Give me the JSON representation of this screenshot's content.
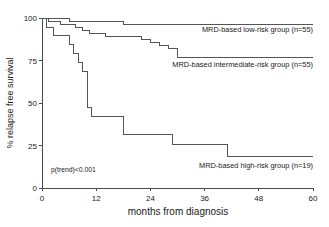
{
  "chart_data": {
    "type": "line",
    "subtype": "kaplan-meier-step",
    "title": "",
    "xlabel": "months from diagnosis",
    "ylabel": "% relapse free survival",
    "xlim": [
      0,
      60
    ],
    "ylim": [
      0,
      100
    ],
    "xticks": [
      0,
      12,
      24,
      36,
      48,
      60
    ],
    "yticks": [
      0,
      25,
      50,
      75,
      100
    ],
    "xtick_labels": [
      "0",
      "12",
      "24",
      "36",
      "48",
      "60"
    ],
    "ytick_labels": [
      "0",
      "25",
      "50",
      "75",
      "100"
    ],
    "grid": false,
    "legend_position": "inline-right-of-curve",
    "annotations": [
      {
        "text": "p(trend)<0.001",
        "x": 2.0,
        "y": 9.5
      }
    ],
    "series": [
      {
        "name": "MRD-based low-risk group (n=55)",
        "n": 55,
        "label": "MRD-based low-risk group (n=55)",
        "label_anchor_x": 60,
        "label_anchor_y": 92,
        "color": "#555555",
        "points": [
          [
            0,
            100
          ],
          [
            6,
            100
          ],
          [
            6,
            98.2
          ],
          [
            18,
            98.2
          ],
          [
            18,
            96.4
          ],
          [
            60,
            96.4
          ]
        ]
      },
      {
        "name": "MRD-based intermediate-risk group (n=55)",
        "n": 55,
        "label": "MRD-based intermediate-risk group (n=55)",
        "label_anchor_x": 60,
        "label_anchor_y": 71,
        "color": "#555555",
        "points": [
          [
            0,
            100
          ],
          [
            1.5,
            100
          ],
          [
            1.5,
            98.2
          ],
          [
            4,
            98.2
          ],
          [
            4,
            96.4
          ],
          [
            7.5,
            96.4
          ],
          [
            7.5,
            94.5
          ],
          [
            9,
            94.5
          ],
          [
            9,
            92.7
          ],
          [
            10.5,
            92.7
          ],
          [
            10.5,
            90.9
          ],
          [
            14,
            90.9
          ],
          [
            14,
            89.1
          ],
          [
            22,
            89.1
          ],
          [
            22,
            87.3
          ],
          [
            24,
            87.3
          ],
          [
            24,
            85.5
          ],
          [
            26,
            85.5
          ],
          [
            26,
            83.6
          ],
          [
            28,
            83.6
          ],
          [
            28,
            81.8
          ],
          [
            30,
            81.8
          ],
          [
            30,
            77.0
          ],
          [
            60,
            77.0
          ]
        ]
      },
      {
        "name": "MRD-based high-risk group (n=19)",
        "n": 19,
        "label": "MRD-based high-risk group (n=19)",
        "label_anchor_x": 60,
        "label_anchor_y": 12,
        "color": "#555555",
        "points": [
          [
            0,
            100
          ],
          [
            1,
            100
          ],
          [
            1,
            94.7
          ],
          [
            2.5,
            94.7
          ],
          [
            2.5,
            89.5
          ],
          [
            6,
            89.5
          ],
          [
            6,
            84.2
          ],
          [
            7,
            84.2
          ],
          [
            7,
            78.9
          ],
          [
            8,
            78.9
          ],
          [
            8,
            73.7
          ],
          [
            9,
            73.7
          ],
          [
            9,
            68.4
          ],
          [
            10,
            68.4
          ],
          [
            10,
            47.4
          ],
          [
            11,
            47.4
          ],
          [
            11,
            42.1
          ],
          [
            18,
            42.1
          ],
          [
            18,
            31.6
          ],
          [
            29,
            31.6
          ],
          [
            29,
            25.3
          ],
          [
            41,
            25.3
          ],
          [
            41,
            18.8
          ],
          [
            60,
            18.8
          ]
        ]
      }
    ]
  },
  "geometry": {
    "origin_x": 42,
    "origin_y": 188,
    "x_max_px": 313,
    "y_top_px": 18
  }
}
